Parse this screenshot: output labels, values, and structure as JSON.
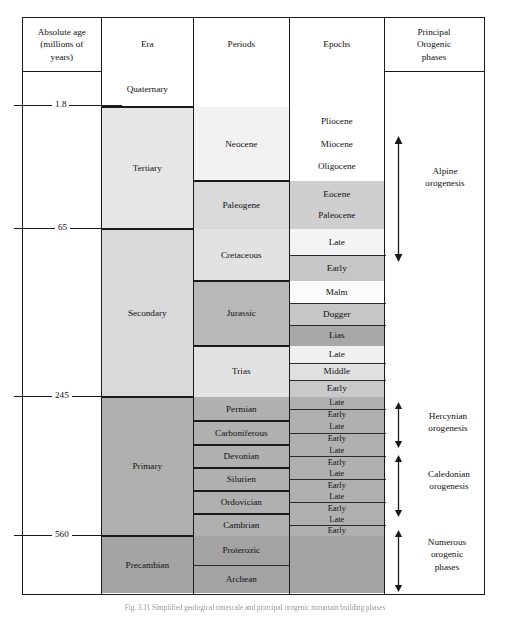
{
  "figure": {
    "type": "geologic-time-scale-table",
    "caption": "Fig. 3.11 Simplified geological timescale and principal orogenic mountain building phases"
  },
  "columns": [
    {
      "id": "absolute_age",
      "header": "Absolute age\n(millions of\nyears)",
      "header_lines": [
        "Absolute age",
        "(millions of",
        "years)"
      ]
    },
    {
      "id": "era",
      "header": "Era",
      "header_lines": [
        "Era"
      ]
    },
    {
      "id": "periods",
      "header": "Periods",
      "header_lines": [
        "Periods"
      ]
    },
    {
      "id": "epochs",
      "header": "Epochs",
      "header_lines": [
        "Epochs"
      ]
    },
    {
      "id": "orogenic",
      "header": "Principal\nOrogenic\nphases",
      "header_lines": [
        "Principal",
        "Orogenic",
        "phases"
      ]
    }
  ],
  "age_ticks": [
    {
      "value": "1.8"
    },
    {
      "value": "65"
    },
    {
      "value": "245"
    },
    {
      "value": "560"
    }
  ],
  "eras": [
    {
      "name": "Quaternary"
    },
    {
      "name": "Tertiary"
    },
    {
      "name": "Secondary"
    },
    {
      "name": "Primary"
    },
    {
      "name": "Precambian"
    }
  ],
  "periods": [
    {
      "name": "Neocene"
    },
    {
      "name": "Paleogene"
    },
    {
      "name": "Cretaceous"
    },
    {
      "name": "Jurassic"
    },
    {
      "name": "Trias"
    },
    {
      "name": "Permian"
    },
    {
      "name": "Carboniferous"
    },
    {
      "name": "Devonian"
    },
    {
      "name": "Silurien"
    },
    {
      "name": "Ordovician"
    },
    {
      "name": "Cambrian"
    },
    {
      "name": "Proterozic"
    },
    {
      "name": "Archean"
    }
  ],
  "epochs": [
    {
      "name": "Pliocene"
    },
    {
      "name": "Miocene"
    },
    {
      "name": "Oligocene"
    },
    {
      "name": "Eocene"
    },
    {
      "name": "Paleocene"
    },
    {
      "name": "Late"
    },
    {
      "name": "Early"
    },
    {
      "name": "Malm"
    },
    {
      "name": "Dogger"
    },
    {
      "name": "Lias"
    },
    {
      "name": "Late"
    },
    {
      "name": "Middle"
    },
    {
      "name": "Early"
    },
    {
      "name": "Late"
    },
    {
      "name": "Early"
    },
    {
      "name": "Late"
    },
    {
      "name": "Early"
    },
    {
      "name": "Late"
    },
    {
      "name": "Early"
    },
    {
      "name": "Late"
    },
    {
      "name": "Early"
    },
    {
      "name": "Late"
    },
    {
      "name": "Early"
    },
    {
      "name": "Late"
    },
    {
      "name": "Early"
    }
  ],
  "orogenic_phases": [
    {
      "lines": [
        "Alpine",
        "orogenesis"
      ],
      "label": "Alpine orogenesis"
    },
    {
      "lines": [
        "Hercynian",
        "orogenesis"
      ],
      "label": "Hercynian orogenesis"
    },
    {
      "lines": [
        "Caledonian",
        "orogenesis"
      ],
      "label": "Caledonian orogenesis"
    },
    {
      "lines": [
        "Numerous",
        "orogenic",
        "phases"
      ],
      "label": "Numerous orogenic phases"
    }
  ],
  "colors": {
    "border": "#1a1a1a",
    "white": "#ffffff",
    "shade_1": "#f2f2f2",
    "shade_2": "#e6e6e6",
    "shade_3": "#d9d9d9",
    "shade_4": "#cccccc",
    "shade_5": "#bdbdbd",
    "shade_6": "#b0b0b0",
    "shade_7": "#a3a3a3",
    "text": "#111111"
  }
}
